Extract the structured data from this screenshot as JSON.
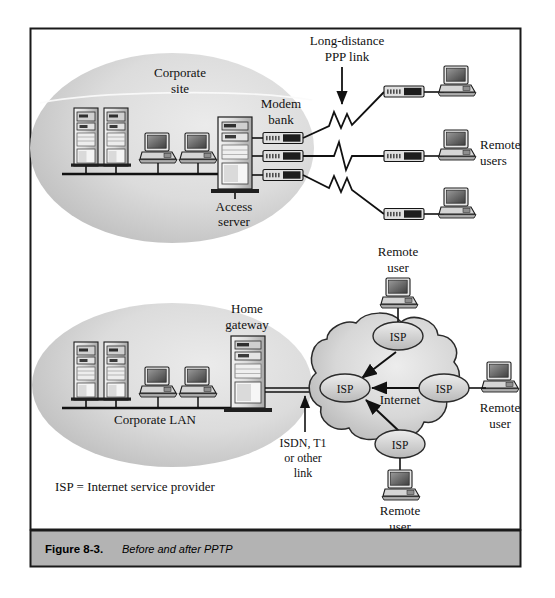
{
  "figure": {
    "caption_number": "Figure 8-3.",
    "caption_title": "Before and after PPTP"
  },
  "top_panel": {
    "cloud_label_line1": "Corporate",
    "cloud_label_line2": "site",
    "modem_bank_line1": "Modem",
    "modem_bank_line2": "bank",
    "access_server_line1": "Access",
    "access_server_line2": "server",
    "ppp_link_line1": "Long-distance",
    "ppp_link_line2": "PPP link",
    "remote_users_line1": "Remote",
    "remote_users_line2": "users",
    "modem_count": 3,
    "server_count": 2,
    "workstation_count": 2,
    "remote_user_count": 3
  },
  "bottom_panel": {
    "corporate_lan_label": "Corporate LAN",
    "home_gateway_line1": "Home",
    "home_gateway_line2": "gateway",
    "wan_link_line1": "ISDN, T1",
    "wan_link_line2": "or other",
    "wan_link_line3": "link",
    "internet_label": "Internet",
    "isp_nodes": [
      "ISP",
      "ISP",
      "ISP",
      "ISP"
    ],
    "remote_user_top_line1": "Remote",
    "remote_user_top_line2": "user",
    "remote_user_right_line1": "Remote",
    "remote_user_right_line2": "user",
    "remote_user_bottom_line1": "Remote",
    "remote_user_bottom_line2": "user",
    "server_count": 2,
    "workstation_count": 2
  },
  "legend": {
    "text": "ISP = Internet service provider"
  },
  "colors": {
    "page_background": "#ffffff",
    "frame_border": "#1a1a1a",
    "caption_bar": "#b3b3b3",
    "ellipse_fill_light": "#e6e6e6",
    "ellipse_fill_dark": "#c2c2c2",
    "cloud_fill_light": "#e4e4e4",
    "cloud_fill_dark": "#bdbdbd",
    "device_body": "#d8d8d8",
    "device_dark": "#4a4a4a",
    "screen": "#6e6e6e",
    "line": "#111111"
  }
}
